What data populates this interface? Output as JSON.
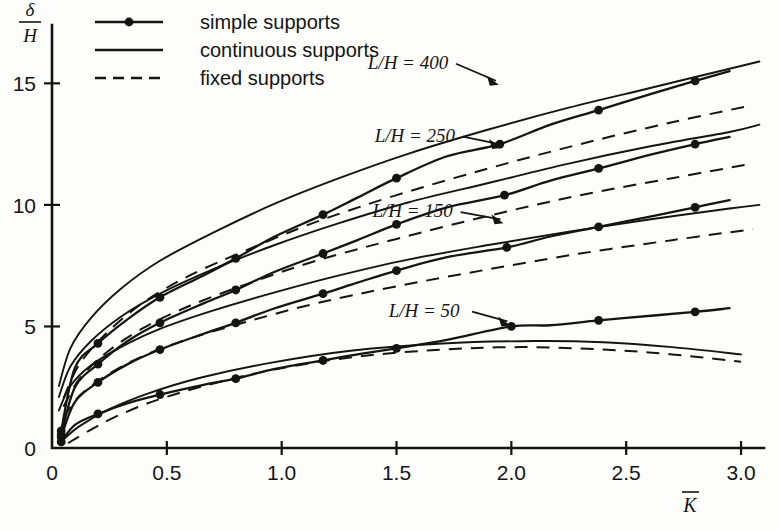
{
  "chart_data": {
    "type": "line",
    "title": "",
    "xlabel": "K̄",
    "ylabel": "δ/H",
    "xlim": [
      0,
      3.1
    ],
    "ylim": [
      0,
      17.4
    ],
    "xticks": [
      0,
      0.5,
      1.0,
      1.5,
      2.0,
      2.5,
      3.0
    ],
    "xticklabels": [
      "0",
      "0.5",
      "1.0",
      "1.5",
      "2.0",
      "2.5",
      "3.0"
    ],
    "yticks": [
      0,
      5,
      10,
      15
    ],
    "yticklabels": [
      "0",
      "5",
      "10",
      "15"
    ],
    "grid": false,
    "legend_position": "top-left",
    "legend": [
      {
        "key": "simple",
        "label": "simple supports",
        "style": "solid-with-markers"
      },
      {
        "key": "continuous",
        "label": "continuous supports",
        "style": "solid"
      },
      {
        "key": "fixed",
        "label": "fixed supports",
        "style": "dashed"
      }
    ],
    "annotations": [
      {
        "text": "L/H = 400",
        "x": 1.55,
        "y": 15.6,
        "points_to_x": 1.95,
        "points_to_y": 14.9
      },
      {
        "text": "L/H = 250",
        "x": 1.58,
        "y": 12.6,
        "points_to_x": 1.96,
        "points_to_y": 12.3
      },
      {
        "text": "L/H = 150",
        "x": 1.57,
        "y": 9.5,
        "points_to_x": 1.97,
        "points_to_y": 9.2
      },
      {
        "text": "L/H = 50",
        "x": 1.62,
        "y": 5.4,
        "points_to_x": 2.0,
        "points_to_y": 5.0
      }
    ],
    "groups": [
      {
        "name": "L/H = 400",
        "series": [
          {
            "name": "simple supports",
            "x": [
              0.04,
              0.1,
              0.2,
              0.33,
              0.47,
              0.66,
              0.8,
              0.97,
              1.18,
              1.33,
              1.5,
              1.72,
              1.95,
              2.17,
              2.38,
              2.62,
              2.8,
              2.95
            ],
            "y": [
              0.7,
              3.3,
              4.3,
              5.3,
              6.2,
              7.1,
              7.8,
              8.7,
              9.6,
              10.3,
              11.1,
              12.0,
              12.5,
              13.3,
              13.9,
              14.6,
              15.1,
              15.5
            ],
            "markers_x": [
              0.04,
              0.2,
              0.47,
              0.8,
              1.18,
              1.5,
              1.95,
              2.38,
              2.8
            ],
            "markers_y": [
              0.7,
              4.3,
              6.2,
              7.8,
              9.6,
              11.1,
              12.5,
              13.9,
              15.1
            ]
          },
          {
            "name": "continuous supports",
            "x": [
              0.03,
              0.08,
              0.17,
              0.3,
              0.47,
              0.7,
              0.97,
              1.25,
              1.55,
              1.9,
              2.25,
              2.6,
              2.95,
              3.08
            ],
            "y": [
              2.55,
              4.1,
              5.35,
              6.55,
              7.7,
              8.85,
              10.05,
              11.1,
              12.1,
              13.1,
              14.0,
              14.8,
              15.6,
              15.9
            ]
          },
          {
            "name": "fixed supports",
            "x": [
              0.05,
              0.12,
              0.24,
              0.4,
              0.6,
              0.85,
              1.15,
              1.5,
              1.9,
              2.3,
              2.7,
              3.05
            ],
            "y": [
              2.05,
              3.45,
              4.75,
              6.0,
              7.1,
              8.15,
              9.3,
              10.4,
              11.5,
              12.5,
              13.4,
              14.1
            ]
          }
        ]
      },
      {
        "name": "L/H = 250",
        "series": [
          {
            "name": "simple supports",
            "x": [
              0.04,
              0.1,
              0.2,
              0.33,
              0.47,
              0.66,
              0.8,
              0.97,
              1.18,
              1.33,
              1.5,
              1.72,
              1.97,
              2.17,
              2.38,
              2.62,
              2.8,
              2.95
            ],
            "y": [
              0.55,
              2.5,
              3.45,
              4.4,
              5.15,
              5.95,
              6.5,
              7.25,
              8.0,
              8.55,
              9.2,
              9.9,
              10.4,
              11.0,
              11.5,
              12.1,
              12.5,
              12.8
            ],
            "markers_x": [
              0.04,
              0.2,
              0.47,
              0.8,
              1.18,
              1.5,
              1.97,
              2.38,
              2.8
            ],
            "markers_y": [
              0.55,
              3.45,
              5.15,
              6.5,
              8.0,
              9.2,
              10.4,
              11.5,
              12.5
            ]
          },
          {
            "name": "continuous supports",
            "x": [
              0.03,
              0.08,
              0.17,
              0.3,
              0.47,
              0.7,
              0.97,
              1.25,
              1.55,
              1.9,
              2.25,
              2.6,
              2.95,
              3.08
            ],
            "y": [
              2.1,
              3.35,
              4.4,
              5.4,
              6.35,
              7.35,
              8.35,
              9.25,
              10.1,
              10.9,
              11.7,
              12.4,
              13.0,
              13.3
            ]
          },
          {
            "name": "fixed supports",
            "x": [
              0.05,
              0.12,
              0.24,
              0.4,
              0.6,
              0.85,
              1.15,
              1.5,
              1.9,
              2.3,
              2.7,
              3.05
            ],
            "y": [
              1.7,
              2.85,
              3.95,
              4.95,
              5.85,
              6.75,
              7.7,
              8.6,
              9.55,
              10.4,
              11.1,
              11.7
            ]
          }
        ]
      },
      {
        "name": "L/H = 150",
        "series": [
          {
            "name": "simple supports",
            "x": [
              0.04,
              0.1,
              0.2,
              0.33,
              0.47,
              0.66,
              0.8,
              0.97,
              1.18,
              1.33,
              1.5,
              1.72,
              1.98,
              2.17,
              2.38,
              2.62,
              2.8,
              2.95
            ],
            "y": [
              0.45,
              1.9,
              2.7,
              3.45,
              4.05,
              4.7,
              5.15,
              5.75,
              6.35,
              6.8,
              7.3,
              7.85,
              8.25,
              8.7,
              9.1,
              9.55,
              9.9,
              10.2
            ],
            "markers_x": [
              0.04,
              0.2,
              0.47,
              0.8,
              1.18,
              1.5,
              1.98,
              2.38,
              2.8
            ],
            "markers_y": [
              0.45,
              2.7,
              4.05,
              5.15,
              6.35,
              7.3,
              8.25,
              9.1,
              9.9
            ]
          },
          {
            "name": "continuous supports",
            "x": [
              0.03,
              0.08,
              0.17,
              0.3,
              0.47,
              0.7,
              0.97,
              1.25,
              1.55,
              1.9,
              2.25,
              2.6,
              2.95,
              3.08
            ],
            "y": [
              1.55,
              2.55,
              3.4,
              4.15,
              4.9,
              5.65,
              6.4,
              7.1,
              7.75,
              8.35,
              8.9,
              9.4,
              9.85,
              10.0
            ]
          },
          {
            "name": "fixed supports",
            "x": [
              0.05,
              0.12,
              0.24,
              0.4,
              0.6,
              0.85,
              1.15,
              1.5,
              1.9,
              2.3,
              2.7,
              3.05
            ],
            "y": [
              1.25,
              2.15,
              3.0,
              3.8,
              4.5,
              5.2,
              5.95,
              6.65,
              7.35,
              8.0,
              8.55,
              9.0
            ]
          }
        ]
      },
      {
        "name": "L/H = 50",
        "series": [
          {
            "name": "simple supports",
            "x": [
              0.04,
              0.1,
              0.2,
              0.33,
              0.47,
              0.66,
              0.8,
              0.97,
              1.18,
              1.33,
              1.5,
              1.72,
              2.0,
              2.17,
              2.38,
              2.62,
              2.8,
              2.95
            ],
            "y": [
              0.25,
              0.95,
              1.4,
              1.85,
              2.2,
              2.6,
              2.85,
              3.25,
              3.6,
              3.85,
              4.1,
              4.45,
              5.0,
              5.05,
              5.25,
              5.45,
              5.6,
              5.75
            ],
            "markers_x": [
              0.04,
              0.2,
              0.47,
              0.8,
              1.18,
              1.5,
              2.0,
              2.38,
              2.8
            ],
            "markers_y": [
              0.25,
              1.4,
              2.2,
              2.85,
              3.6,
              4.1,
              5.0,
              5.25,
              5.6
            ]
          },
          {
            "name": "continuous supports",
            "x": [
              0.05,
              0.12,
              0.25,
              0.42,
              0.65,
              0.95,
              1.3,
              1.7,
              2.1,
              2.4,
              2.7,
              3.0
            ],
            "y": [
              0.35,
              0.9,
              1.6,
              2.25,
              2.9,
              3.5,
              4.0,
              4.3,
              4.4,
              4.35,
              4.15,
              3.85
            ]
          },
          {
            "name": "fixed supports",
            "x": [
              0.07,
              0.15,
              0.28,
              0.45,
              0.68,
              0.98,
              1.32,
              1.7,
              2.05,
              2.4,
              2.7,
              3.0
            ],
            "y": [
              0.2,
              0.65,
              1.3,
              1.95,
              2.6,
              3.25,
              3.75,
              4.05,
              4.15,
              4.05,
              3.85,
              3.55
            ]
          }
        ]
      }
    ]
  }
}
